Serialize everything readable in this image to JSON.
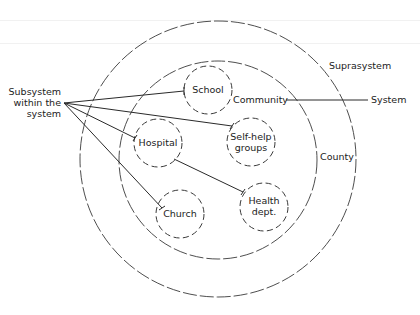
{
  "diagram": {
    "type": "nested-systems",
    "colors": {
      "stroke": "#3a3a3a",
      "text": "#222222",
      "background": "#ffffff"
    },
    "circles": {
      "suprasystem": {
        "label": "Suprasystem",
        "cx": 218,
        "cy": 159,
        "r": 138
      },
      "system": {
        "label": "County",
        "cx": 218,
        "cy": 160,
        "r": 99
      }
    },
    "subsystems": [
      {
        "id": "school",
        "lines": [
          "School"
        ],
        "cx": 208,
        "cy": 90,
        "r": 24
      },
      {
        "id": "hospital",
        "lines": [
          "Hospital"
        ],
        "cx": 158,
        "cy": 143,
        "r": 24
      },
      {
        "id": "self-help-groups",
        "lines": [
          "Self-help",
          "groups"
        ],
        "cx": 251,
        "cy": 142,
        "r": 24
      },
      {
        "id": "church",
        "lines": [
          "Church"
        ],
        "cx": 180,
        "cy": 214,
        "r": 24
      },
      {
        "id": "health-dept",
        "lines": [
          "Health",
          "dept."
        ],
        "cx": 264,
        "cy": 207,
        "r": 24
      }
    ],
    "labels": {
      "suprasystem": "Suprasystem",
      "community": "Community",
      "system": "System",
      "county": "County",
      "subsystem_line1": "Subsystem",
      "subsystem_line2": "within the",
      "subsystem_line3": "system",
      "school": "School",
      "hospital": "Hospital",
      "selfhelp_line1": "Self-help",
      "selfhelp_line2": "groups",
      "church": "Church",
      "health_line1": "Health",
      "health_line2": "dept."
    },
    "connectors": [
      {
        "from": "Subsystem within the system",
        "to": "School"
      },
      {
        "from": "Subsystem within the system",
        "to": "Self-help groups"
      },
      {
        "from": "Subsystem within the system",
        "to": "Hospital"
      },
      {
        "from": "Subsystem within the system",
        "to": "Church"
      },
      {
        "from": "Hospital",
        "to": "Health dept."
      },
      {
        "from": "Community",
        "to": "System"
      }
    ]
  }
}
